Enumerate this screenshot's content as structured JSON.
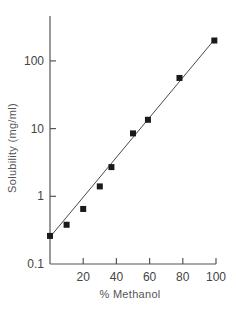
{
  "chart_data": {
    "type": "scatter",
    "title": "",
    "xlabel": "% Methanol",
    "ylabel": "Solubility (mg/ml)",
    "xlim": [
      0,
      100
    ],
    "ylim": [
      0.1,
      500
    ],
    "yscale": "log",
    "grid": false,
    "legend": null,
    "x_ticks": [
      {
        "value": 20,
        "label": "20"
      },
      {
        "value": 40,
        "label": "40"
      },
      {
        "value": 60,
        "label": "60"
      },
      {
        "value": 80,
        "label": "80"
      },
      {
        "value": 100,
        "label": "100"
      }
    ],
    "y_ticks": [
      {
        "value": 0.1,
        "label": "0.1"
      },
      {
        "value": 1,
        "label": "1"
      },
      {
        "value": 10,
        "label": "10"
      },
      {
        "value": 100,
        "label": "100"
      }
    ],
    "series": [
      {
        "name": "Measured solubility",
        "marker": "square",
        "x": [
          0,
          10,
          20,
          30,
          37,
          50,
          59,
          78,
          99
        ],
        "y": [
          0.26,
          0.38,
          0.65,
          1.4,
          2.7,
          8.5,
          13.5,
          56,
          200
        ]
      },
      {
        "name": "Fit line",
        "style": "line",
        "x": [
          0,
          100
        ],
        "y": [
          0.25,
          220
        ]
      }
    ]
  },
  "colors": {
    "axis": "#555555",
    "marker": "#1a1a1a",
    "line": "#4a4a4a"
  }
}
